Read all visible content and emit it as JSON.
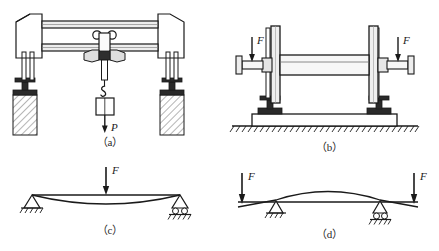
{
  "figure": {
    "type": "engineering-mechanics-figure",
    "panel_count": 4,
    "colors": {
      "stroke": "#1a1a1a",
      "fill_light": "#f2f2f2",
      "fill_mid": "#d8d8d8",
      "fill_dark": "#3a3a3a",
      "background": "#ffffff"
    },
    "panels": [
      {
        "id": "a",
        "caption": "（a）",
        "title": "overhead-crane-girder",
        "load_label": "P",
        "load_direction": "down",
        "elements": [
          "left-column",
          "right-column",
          "upper-girder",
          "lower-girder",
          "trolley",
          "hook",
          "lifted-load",
          "hatched-foundation-left",
          "hatched-foundation-right"
        ]
      },
      {
        "id": "b",
        "caption": "（b）",
        "title": "shaft-on-bearing-pedestals",
        "load_labels": [
          "F",
          "F"
        ],
        "load_direction": "down",
        "elements": [
          "left-flange-disc",
          "right-flange-disc",
          "central-shaft",
          "left-journal",
          "right-journal",
          "left-pedestal",
          "right-pedestal",
          "base-plate",
          "ground-hatching"
        ]
      },
      {
        "id": "c",
        "caption": "（c）",
        "title": "simply-supported-beam-central-load",
        "load_label": "F",
        "load_direction": "down",
        "deflection": "sagging",
        "left_support": "pin-support",
        "right_support": "roller-support"
      },
      {
        "id": "d",
        "caption": "（d）",
        "title": "overhanging-beam-end-loads",
        "load_labels": [
          "F",
          "F"
        ],
        "load_direction": "down",
        "deflection": "hogging",
        "left_support": "pin-support",
        "right_support": "roller-support"
      }
    ]
  },
  "labels": {
    "P": "P",
    "F": "F",
    "caption_a": "（a）",
    "caption_b": "（b）",
    "caption_c": "（c）",
    "caption_d": "（d）"
  }
}
